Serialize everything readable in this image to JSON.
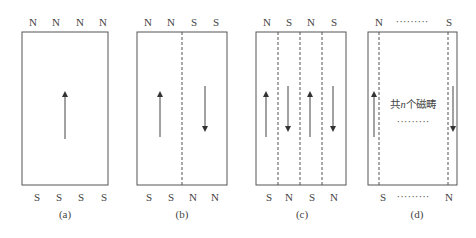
{
  "panels": [
    {
      "id": "a",
      "caption": "(a)",
      "top_labels": [
        "N",
        "N",
        "N",
        "N"
      ],
      "bottom_labels": [
        "S",
        "S",
        "S",
        "S"
      ],
      "domains": 1,
      "arrows": [
        "up"
      ]
    },
    {
      "id": "b",
      "caption": "(b)",
      "top_labels": [
        "N",
        "N",
        "S",
        "S"
      ],
      "bottom_labels": [
        "S",
        "S",
        "N",
        "N"
      ],
      "domains": 2,
      "arrows": [
        "up",
        "down"
      ]
    },
    {
      "id": "c",
      "caption": "(c)",
      "top_labels": [
        "N",
        "S",
        "N",
        "S"
      ],
      "bottom_labels": [
        "S",
        "N",
        "S",
        "N"
      ],
      "domains": 4,
      "arrows": [
        "up",
        "down",
        "up",
        "down"
      ]
    },
    {
      "id": "d",
      "caption": "(d)",
      "top_labels": [
        "N",
        "S"
      ],
      "top_ellipsis": "·········",
      "bottom_labels": [
        "S",
        "N"
      ],
      "bottom_ellipsis": "·········",
      "center_text_prefix": "共",
      "center_text_var": "n",
      "center_text_suffix": "个磁畴",
      "center_ellipsis": "·········",
      "arrows": [
        "up",
        "down"
      ]
    }
  ],
  "colors": {
    "line": "#555555",
    "text": "#444444"
  }
}
